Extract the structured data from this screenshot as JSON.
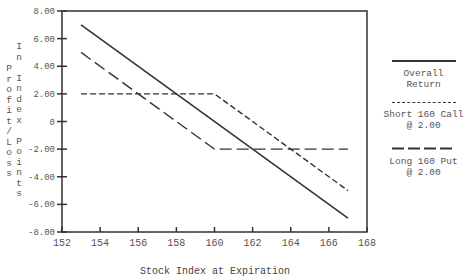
{
  "chart_data": {
    "type": "line",
    "title": "",
    "xlabel": "Stock Index at Expiration",
    "ylabel_outer": "Profit/Loss",
    "ylabel_inner": "In Index Points",
    "xlim": [
      152,
      168
    ],
    "ylim": [
      -8,
      8
    ],
    "grid": false,
    "legend_position": "right",
    "x_ticks": [
      "152",
      "154",
      "156",
      "158",
      "160",
      "162",
      "164",
      "166",
      "168"
    ],
    "y_ticks": [
      "8.00",
      "6.00",
      "4.00",
      "2.00",
      "0",
      "-2.00",
      "-4.00",
      "-6.00",
      "-8.00"
    ],
    "series": [
      {
        "name": "Overall Return",
        "style": "solid",
        "x": [
          153,
          167
        ],
        "y": [
          7.0,
          -7.0
        ]
      },
      {
        "name": "Short 160 Call @ 2.00",
        "style": "short-dash",
        "x": [
          153,
          160,
          167
        ],
        "y": [
          2.0,
          2.0,
          -5.0
        ]
      },
      {
        "name": "Long 160 Put @ 2.00",
        "style": "long-dash",
        "x": [
          153,
          160,
          167
        ],
        "y": [
          5.0,
          -2.0,
          -2.0
        ]
      }
    ]
  },
  "legend": [
    {
      "line1": "Overall",
      "line2": "Return"
    },
    {
      "line1": "Short 160 Call",
      "line2": "@ 2.00"
    },
    {
      "line1": "Long 160 Put",
      "line2": "@ 2.00"
    }
  ],
  "axis_labels": {
    "x": "Stock Index at Expiration",
    "y_outer": [
      "P",
      "r",
      "o",
      "f",
      "i",
      "t",
      "/",
      "L",
      "o",
      "s",
      "s"
    ],
    "y_inner": [
      "I",
      "n",
      " ",
      "I",
      "n",
      "d",
      "e",
      "x",
      " ",
      "P",
      "o",
      "i",
      "n",
      "t",
      "s"
    ]
  },
  "colors": {
    "line": "#333333",
    "axis": "#333333",
    "text": "#555555"
  }
}
